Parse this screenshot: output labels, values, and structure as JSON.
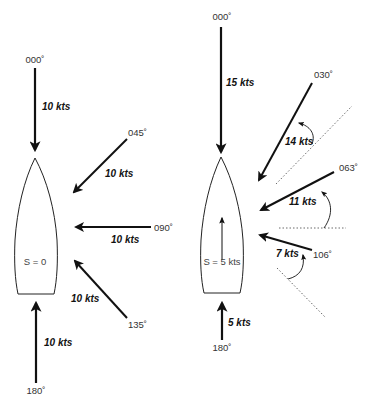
{
  "diagram": {
    "type": "apparent wind vector diagram",
    "colors": {
      "line": "#111111",
      "text": "#333333",
      "background": "#ffffff"
    },
    "left": {
      "boat_label": "S = 0",
      "winds": [
        {
          "id": "000",
          "heading": "000˚",
          "speed": "10 kts"
        },
        {
          "id": "045",
          "heading": "045˚",
          "speed": "10 kts"
        },
        {
          "id": "090",
          "heading": "090˚",
          "speed": "10 kts"
        },
        {
          "id": "135",
          "heading": "135˚",
          "speed": "10 kts"
        },
        {
          "id": "180",
          "heading": "180˚",
          "speed": "10 kts"
        }
      ]
    },
    "right": {
      "boat_label": "S = 5 kts",
      "winds": [
        {
          "id": "000",
          "heading": "000˚",
          "speed": "15 kts"
        },
        {
          "id": "030",
          "heading": "030˚",
          "speed": "14 kts"
        },
        {
          "id": "063",
          "heading": "063˚",
          "speed": "11 kts"
        },
        {
          "id": "106",
          "heading": "106˚",
          "speed": "7 kts"
        },
        {
          "id": "180",
          "heading": "180˚",
          "speed": "5 kts"
        }
      ]
    }
  }
}
